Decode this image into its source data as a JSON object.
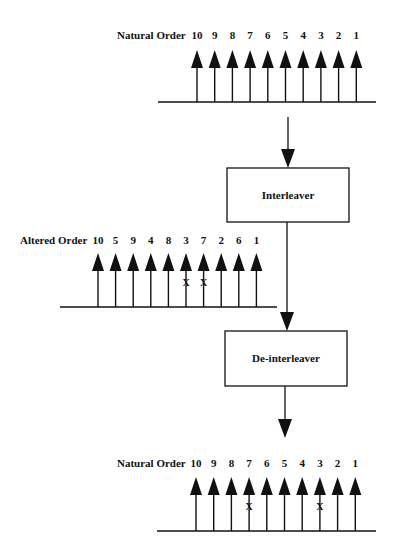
{
  "diagram": {
    "top_row": {
      "label": "Natural Order",
      "values": [
        "10",
        "9",
        "8",
        "7",
        "6",
        "5",
        "4",
        "3",
        "2",
        "1"
      ],
      "errors": []
    },
    "interleaver": {
      "label": "Interleaver"
    },
    "middle_row": {
      "label": "Altered Order",
      "values": [
        "10",
        "5",
        "9",
        "4",
        "8",
        "3",
        "7",
        "2",
        "6",
        "1"
      ],
      "errors": [
        "3",
        "7"
      ]
    },
    "deinterleaver": {
      "label": "De-interleaver"
    },
    "bottom_row": {
      "label": "Natural Order",
      "values": [
        "10",
        "9",
        "8",
        "7",
        "6",
        "5",
        "4",
        "3",
        "2",
        "1"
      ],
      "errors": [
        "7",
        "3"
      ]
    },
    "error_mark": "X"
  }
}
